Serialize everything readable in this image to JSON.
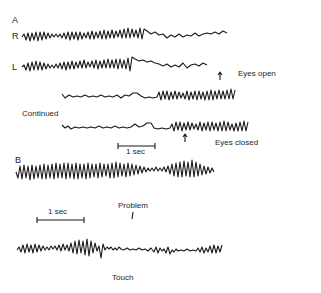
{
  "figure": {
    "panel_a": {
      "label": "A",
      "channels": [
        {
          "label": "R"
        },
        {
          "label": "L"
        }
      ],
      "continued_label": "Continued",
      "annotations": {
        "eyes_open": "Eyes open",
        "eyes_closed": "Eyes closed"
      },
      "scale_bar": "1 sec"
    },
    "panel_b": {
      "label": "B",
      "scale_bar": "1 sec",
      "annotations": {
        "problem": "Problem",
        "touch": "Touch"
      }
    }
  }
}
